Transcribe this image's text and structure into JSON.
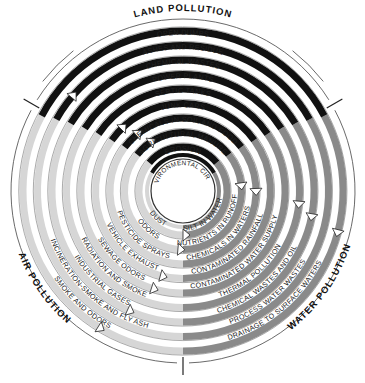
{
  "diagram": {
    "center": [
      183,
      191
    ],
    "inner_label": "ENVIRONMENTAL CIRCLE",
    "colors": {
      "land": "#111111",
      "water": "#8a8a8a",
      "air": "#d6d6d6",
      "outline": "#333333",
      "background": "#ffffff"
    },
    "sectors": [
      {
        "id": "land",
        "title": "LAND POLLUTION",
        "color": "#111111"
      },
      {
        "id": "water",
        "title": "WATER POLLUTION",
        "color": "#8a8a8a"
      },
      {
        "id": "air",
        "title": "AIR POLLUTION",
        "color": "#d6d6d6"
      }
    ],
    "land_items": [
      "OPEN DUMPS",
      "ASHES AND RESIDUE",
      "CHEMICAL WASTES",
      "POWER PLANTS",
      "SEPTIC TANKS",
      "JUNK CARS",
      "CHEMICALS IN SOIL AND FOOD",
      "AGRICULTURAL MANURE",
      "EROSION"
    ],
    "water_items": [
      "SILT IN WATER",
      "NUTRIENTS IN RUNOFF",
      "CHEMICALS IN WATERS",
      "CONTAMINATED RAINFALL",
      "CONTAMINATED WATER SUPPLY",
      "THERMAL POLLUTION",
      "CHEMICAL WASTES AND OIL",
      "PROCESS WATER WASTES",
      "DRAINAGE TO SURFACE WATERS"
    ],
    "air_items": [
      "DUST",
      "ODORS",
      "PESTICIDE SPRAYS",
      "VEHICLE EXHAUST",
      "SEWAGE ODORS",
      "RADIATION AND SMOKE",
      "INDUSTRIAL GASES",
      "INCINERATION-SMOKE AND FLY ASH",
      "SMOKE AND ODORS"
    ]
  }
}
